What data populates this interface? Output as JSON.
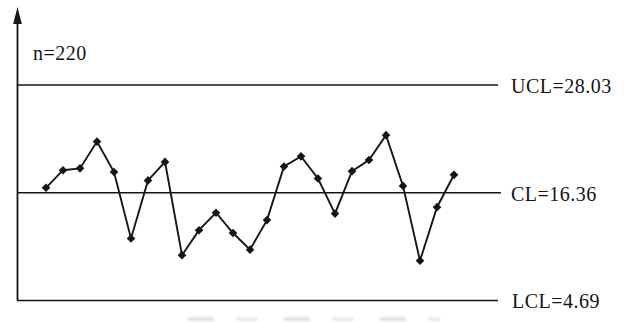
{
  "colors": {
    "ink": "#161616",
    "background": "#ffffff"
  },
  "chart_data": {
    "type": "line",
    "title": "",
    "chart_kind": "control-chart",
    "labels": {
      "n": "n=220",
      "ucl": "UCL=28.03",
      "cl": "CL=16.36",
      "lcl": "LCL=4.69"
    },
    "limits": {
      "ucl": 28.03,
      "cl": 16.36,
      "lcl": 4.69
    },
    "sample_size": 220,
    "x": [
      1,
      2,
      3,
      4,
      5,
      6,
      7,
      8,
      9,
      10,
      11,
      12,
      13,
      14,
      15,
      16,
      17,
      18,
      19,
      20,
      21,
      22,
      23,
      24,
      25
    ],
    "values": [
      16.9,
      18.8,
      19.0,
      21.9,
      18.6,
      11.4,
      17.7,
      19.7,
      9.6,
      12.3,
      14.2,
      12.0,
      10.2,
      13.4,
      19.2,
      20.3,
      17.9,
      14.1,
      18.7,
      19.9,
      22.6,
      17.1,
      9.0,
      14.8,
      18.3
    ],
    "marker": "diamond",
    "grid": false,
    "legend": false,
    "xlabel": "",
    "ylabel": ""
  }
}
